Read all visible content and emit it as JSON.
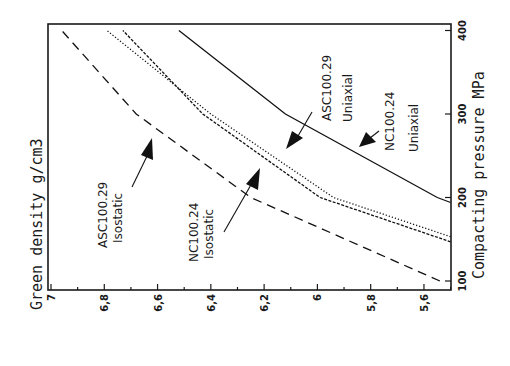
{
  "chart_data": {
    "type": "line",
    "orientation": "rotated 90° counter-clockwise (pressure axis vertical on right, density axis horizontal at bottom, decreasing left to right)",
    "title": "",
    "xlabel": "Compacting pressure  MPa",
    "ylabel": "Green density  g/cm3",
    "xlim": [
      90,
      410
    ],
    "ylim": [
      5.5,
      7.0
    ],
    "x_ticks": [
      100,
      200,
      300,
      400
    ],
    "y_ticks": [
      7,
      6.8,
      6.6,
      6.4,
      6.2,
      6,
      5.8,
      5.6
    ],
    "y_tick_labels": [
      "7",
      "6,8",
      "6,6",
      "6,4",
      "6,2",
      "6",
      "5,8",
      "5,6"
    ],
    "grid": false,
    "series": [
      {
        "name": "ASC100.29 Isostatic",
        "style": "dashed",
        "x": [
          100,
          200,
          300,
          400
        ],
        "y": [
          5.54,
          6.25,
          6.68,
          6.96
        ]
      },
      {
        "name": "NC100.24 Isostatic",
        "style": "dash-dot",
        "x": [
          147,
          200,
          300,
          400
        ],
        "y": [
          5.5,
          5.99,
          6.43,
          6.73
        ]
      },
      {
        "name": "ASC100.29 Uniaxial",
        "style": "dotted",
        "x": [
          153,
          200,
          300,
          400
        ],
        "y": [
          5.5,
          5.94,
          6.4,
          6.79
        ]
      },
      {
        "name": "NC100.24 Uniaxial",
        "style": "solid",
        "x": [
          194,
          200,
          300,
          400
        ],
        "y": [
          5.5,
          5.55,
          6.12,
          6.52
        ]
      }
    ],
    "annotations": [
      {
        "text": [
          "ASC100.29",
          "Isostatic"
        ],
        "points_to": "ASC100.29 Isostatic"
      },
      {
        "text": [
          "NC100.24",
          "Isostatic"
        ],
        "points_to": "NC100.24 Isostatic"
      },
      {
        "text": [
          "ASC100.29",
          "Uniaxial"
        ],
        "points_to": "ASC100.29 Uniaxial"
      },
      {
        "text": [
          "NC100.24",
          "Uniaxial"
        ],
        "points_to": "NC100.24 Uniaxial"
      }
    ]
  },
  "labels": {
    "ylabel": "Green density  g/cm3",
    "xlabel": "Compacting pressure  MPa",
    "ann_asc_iso_1": "ASC100.29",
    "ann_asc_iso_2": "Isostatic",
    "ann_nc_iso_1": "NC100.24",
    "ann_nc_iso_2": "Isostatic",
    "ann_asc_uni_1": "ASC100.29",
    "ann_asc_uni_2": "Uniaxial",
    "ann_nc_uni_1": "NC100.24",
    "ann_nc_uni_2": "Uniaxial"
  }
}
